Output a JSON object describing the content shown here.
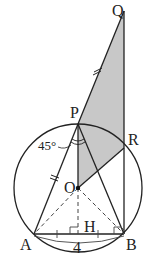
{
  "diagram": {
    "points": {
      "Q": {
        "label": "Q",
        "x": 124,
        "y": 11
      },
      "P": {
        "label": "P",
        "x": 78,
        "y": 124
      },
      "R": {
        "label": "R",
        "x": 124,
        "y": 148
      },
      "O": {
        "label": "O",
        "x": 78,
        "y": 188
      },
      "A": {
        "label": "A",
        "x": 34,
        "y": 234
      },
      "B": {
        "label": "B",
        "x": 124,
        "y": 234
      },
      "H": {
        "label": "H",
        "x": 78,
        "y": 234
      }
    },
    "circle": {
      "cx": 78,
      "cy": 188,
      "r": 64
    },
    "angle_label": "45°",
    "length_label": "4",
    "shade_color": "#c8c8c8",
    "line_color": "#222222"
  }
}
